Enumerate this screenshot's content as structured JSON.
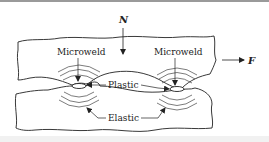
{
  "diagram": {
    "title": "",
    "labels": {
      "normal_force": "N",
      "friction_force": "F",
      "microweld_left": "Microweld",
      "microweld_right": "Microweld",
      "plastic": "Plastic",
      "elastic": "Elastic"
    },
    "colors": {
      "line": "#222222",
      "background": "#ffffff",
      "top_border": "#9a9a9a"
    }
  }
}
